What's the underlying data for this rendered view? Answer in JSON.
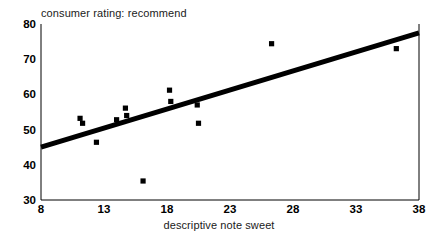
{
  "chart_data": {
    "type": "scatter",
    "title": "consumer rating: recommend",
    "xlabel": "descriptive note sweet",
    "ylabel": "",
    "xlim": [
      8,
      38
    ],
    "ylim": [
      30,
      80
    ],
    "xticks": [
      8,
      13,
      18,
      23,
      28,
      33,
      38
    ],
    "yticks": [
      30,
      40,
      50,
      60,
      70,
      80
    ],
    "grid": false,
    "legend": null,
    "marker": "filled-square",
    "marker_color": "#000000",
    "points": [
      {
        "x": 11.1,
        "y": 53.2
      },
      {
        "x": 11.3,
        "y": 51.8
      },
      {
        "x": 12.4,
        "y": 46.4
      },
      {
        "x": 14.0,
        "y": 52.8
      },
      {
        "x": 14.7,
        "y": 56.1
      },
      {
        "x": 14.8,
        "y": 54.0
      },
      {
        "x": 16.1,
        "y": 35.4
      },
      {
        "x": 18.2,
        "y": 61.2
      },
      {
        "x": 18.3,
        "y": 58.0
      },
      {
        "x": 20.4,
        "y": 57.0
      },
      {
        "x": 20.5,
        "y": 51.8
      },
      {
        "x": 26.3,
        "y": 74.4
      },
      {
        "x": 36.2,
        "y": 73.0
      }
    ],
    "trendline": {
      "type": "linear-fit",
      "color": "#000000",
      "width_px": 5,
      "x_start": 8,
      "y_start": 45.0,
      "x_end": 38,
      "y_end": 77.5
    }
  }
}
